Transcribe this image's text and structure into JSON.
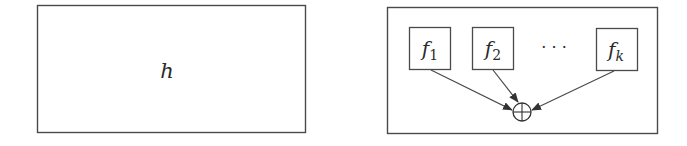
{
  "colors": {
    "stroke": "#4a4a4a",
    "text": "#2a2a2a",
    "background": "#ffffff"
  },
  "left_panel": {
    "label": "h"
  },
  "right_panel": {
    "functions": [
      {
        "base": "f",
        "subscript": "1"
      },
      {
        "base": "f",
        "subscript": "2"
      },
      {
        "base": "f",
        "subscript": "k"
      }
    ],
    "ellipsis": "· · ·",
    "combiner_symbol": "oplus",
    "arrows": [
      {
        "from": "f1",
        "to": "combiner"
      },
      {
        "from": "f2",
        "to": "combiner"
      },
      {
        "from": "fk",
        "to": "combiner"
      }
    ]
  }
}
